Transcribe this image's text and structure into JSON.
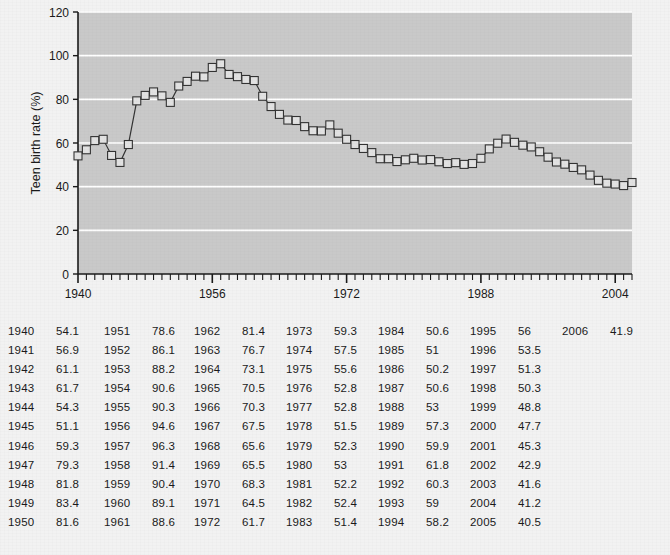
{
  "chart_data": {
    "type": "line",
    "title": "",
    "xlabel": "",
    "ylabel": "Teen birth rate (%)",
    "ylim": [
      0,
      120
    ],
    "xlim": [
      1940,
      2006
    ],
    "yticks": [
      0,
      20,
      40,
      60,
      80,
      100,
      120
    ],
    "xticks": [
      1940,
      1956,
      1972,
      1988,
      2004
    ],
    "grid": "horizontal-white",
    "marker": "square",
    "legend": "none",
    "x": [
      1940,
      1941,
      1942,
      1943,
      1944,
      1945,
      1946,
      1947,
      1948,
      1949,
      1950,
      1951,
      1952,
      1953,
      1954,
      1955,
      1956,
      1957,
      1958,
      1959,
      1960,
      1961,
      1962,
      1963,
      1964,
      1965,
      1966,
      1967,
      1968,
      1969,
      1970,
      1971,
      1972,
      1973,
      1974,
      1975,
      1976,
      1977,
      1978,
      1979,
      1980,
      1981,
      1982,
      1983,
      1984,
      1985,
      1986,
      1987,
      1988,
      1989,
      1990,
      1991,
      1992,
      1993,
      1994,
      1995,
      1996,
      1997,
      1998,
      1999,
      2000,
      2001,
      2002,
      2003,
      2004,
      2005,
      2006
    ],
    "values": [
      54.1,
      56.9,
      61.1,
      61.7,
      54.3,
      51.1,
      59.3,
      79.3,
      81.8,
      83.4,
      81.6,
      78.6,
      86.1,
      88.2,
      90.6,
      90.3,
      94.6,
      96.3,
      91.4,
      90.4,
      89.1,
      88.6,
      81.4,
      76.7,
      73.1,
      70.5,
      70.3,
      67.5,
      65.6,
      65.5,
      68.3,
      64.5,
      61.7,
      59.3,
      57.5,
      55.6,
      52.8,
      52.8,
      51.5,
      52.3,
      53,
      52.2,
      52.4,
      51.4,
      50.6,
      51,
      50.2,
      50.6,
      53,
      57.3,
      59.9,
      61.8,
      60.3,
      59,
      58.2,
      56,
      53.5,
      51.3,
      50.3,
      48.8,
      47.7,
      45.3,
      42.9,
      41.6,
      41.2,
      40.5,
      41.9
    ]
  },
  "axis": {
    "y_label": "Teen birth rate (%)",
    "y_ticks": [
      "0",
      "20",
      "40",
      "60",
      "80",
      "100",
      "120"
    ],
    "x_ticks": [
      "1940",
      "1956",
      "1972",
      "1988",
      "2004"
    ]
  },
  "colors": {
    "page_bg": "#f2f2f2",
    "plot_bg": "#c9c9c9",
    "gridline": "#ffffff",
    "axis": "#1a1a1a",
    "series_line": "#333333",
    "marker_fill": "#e2e2e2",
    "marker_stroke": "#333333",
    "text": "#1a1a1a"
  },
  "table": {
    "columns": [
      {
        "rows": [
          {
            "year": "1940",
            "value": "54.1"
          },
          {
            "year": "1941",
            "value": "56.9"
          },
          {
            "year": "1942",
            "value": "61.1"
          },
          {
            "year": "1943",
            "value": "61.7"
          },
          {
            "year": "1944",
            "value": "54.3"
          },
          {
            "year": "1945",
            "value": "51.1"
          },
          {
            "year": "1946",
            "value": "59.3"
          },
          {
            "year": "1947",
            "value": "79.3"
          },
          {
            "year": "1948",
            "value": "81.8"
          },
          {
            "year": "1949",
            "value": "83.4"
          },
          {
            "year": "1950",
            "value": "81.6"
          }
        ]
      },
      {
        "rows": [
          {
            "year": "1951",
            "value": "78.6"
          },
          {
            "year": "1952",
            "value": "86.1"
          },
          {
            "year": "1953",
            "value": "88.2"
          },
          {
            "year": "1954",
            "value": "90.6"
          },
          {
            "year": "1955",
            "value": "90.3"
          },
          {
            "year": "1956",
            "value": "94.6"
          },
          {
            "year": "1957",
            "value": "96.3"
          },
          {
            "year": "1958",
            "value": "91.4"
          },
          {
            "year": "1959",
            "value": "90.4"
          },
          {
            "year": "1960",
            "value": "89.1"
          },
          {
            "year": "1961",
            "value": "88.6"
          }
        ]
      },
      {
        "rows": [
          {
            "year": "1962",
            "value": "81.4"
          },
          {
            "year": "1963",
            "value": "76.7"
          },
          {
            "year": "1964",
            "value": "73.1"
          },
          {
            "year": "1965",
            "value": "70.5"
          },
          {
            "year": "1966",
            "value": "70.3"
          },
          {
            "year": "1967",
            "value": "67.5"
          },
          {
            "year": "1968",
            "value": "65.6"
          },
          {
            "year": "1969",
            "value": "65.5"
          },
          {
            "year": "1970",
            "value": "68.3"
          },
          {
            "year": "1971",
            "value": "64.5"
          },
          {
            "year": "1972",
            "value": "61.7"
          }
        ]
      },
      {
        "rows": [
          {
            "year": "1973",
            "value": "59.3"
          },
          {
            "year": "1974",
            "value": "57.5"
          },
          {
            "year": "1975",
            "value": "55.6"
          },
          {
            "year": "1976",
            "value": "52.8"
          },
          {
            "year": "1977",
            "value": "52.8"
          },
          {
            "year": "1978",
            "value": "51.5"
          },
          {
            "year": "1979",
            "value": "52.3"
          },
          {
            "year": "1980",
            "value": "53"
          },
          {
            "year": "1981",
            "value": "52.2"
          },
          {
            "year": "1982",
            "value": "52.4"
          },
          {
            "year": "1983",
            "value": "51.4"
          }
        ]
      },
      {
        "rows": [
          {
            "year": "1984",
            "value": "50.6"
          },
          {
            "year": "1985",
            "value": "51"
          },
          {
            "year": "1986",
            "value": "50.2"
          },
          {
            "year": "1987",
            "value": "50.6"
          },
          {
            "year": "1988",
            "value": "53"
          },
          {
            "year": "1989",
            "value": "57.3"
          },
          {
            "year": "1990",
            "value": "59.9"
          },
          {
            "year": "1991",
            "value": "61.8"
          },
          {
            "year": "1992",
            "value": "60.3"
          },
          {
            "year": "1993",
            "value": "59"
          },
          {
            "year": "1994",
            "value": "58.2"
          }
        ]
      },
      {
        "rows": [
          {
            "year": "1995",
            "value": "56"
          },
          {
            "year": "1996",
            "value": "53.5"
          },
          {
            "year": "1997",
            "value": "51.3"
          },
          {
            "year": "1998",
            "value": "50.3"
          },
          {
            "year": "1999",
            "value": "48.8"
          },
          {
            "year": "2000",
            "value": "47.7"
          },
          {
            "year": "2001",
            "value": "45.3"
          },
          {
            "year": "2002",
            "value": "42.9"
          },
          {
            "year": "2003",
            "value": "41.6"
          },
          {
            "year": "2004",
            "value": "41.2"
          },
          {
            "year": "2005",
            "value": "40.5"
          }
        ]
      },
      {
        "rows": [
          {
            "year": "2006",
            "value": "41.9"
          }
        ]
      }
    ]
  }
}
